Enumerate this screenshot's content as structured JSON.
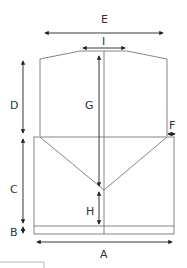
{
  "diagram": {
    "type": "dimension-drawing",
    "colors": {
      "line": "#555555",
      "arrow": "#222222",
      "text": "#333333",
      "background": "#ffffff"
    },
    "labels": {
      "A": "A",
      "B": "B",
      "C": "C",
      "D": "D",
      "E": "E",
      "F": "F",
      "G": "G",
      "H": "H",
      "I": "I"
    }
  }
}
